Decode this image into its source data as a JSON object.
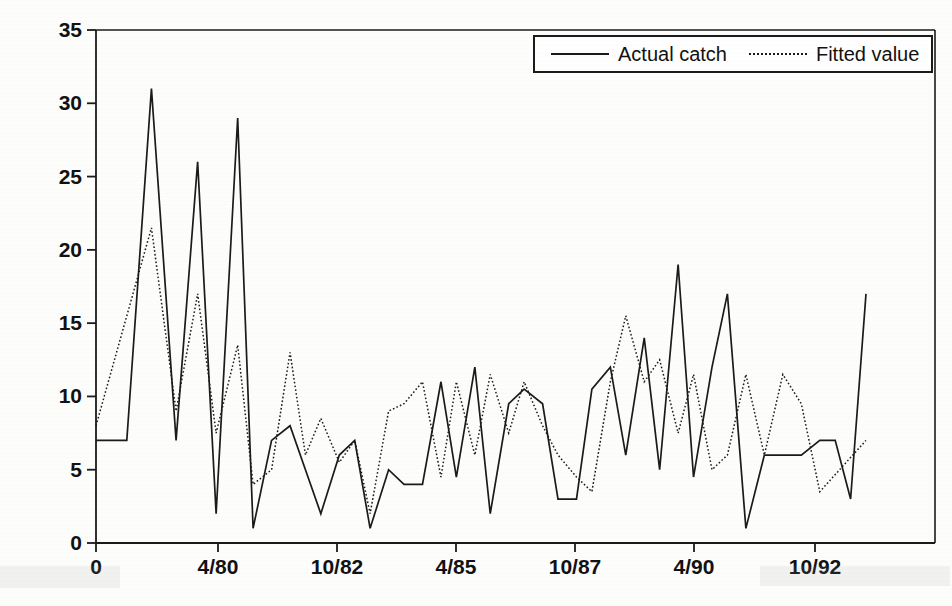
{
  "figure": {
    "background_color": "#fdfdfc",
    "ink_color": "#1a1a1a"
  },
  "legend": {
    "position": "top-right",
    "entries": [
      {
        "label": "Actual catch",
        "style": "solid",
        "swatch": "solid-line-swatch"
      },
      {
        "label": "Fitted value",
        "style": "dotted",
        "swatch": "dotted-line-swatch"
      }
    ]
  },
  "axes": {
    "y_label": "Number caught",
    "y_ticks": [
      "0",
      "5",
      "10",
      "15",
      "20",
      "25",
      "30",
      "35"
    ],
    "x_ticks": [
      "0",
      "4/80",
      "10/82",
      "4/85",
      "10/87",
      "4/90",
      "10/92"
    ],
    "x_label": ""
  },
  "chart_data": {
    "type": "line",
    "title": "",
    "xlabel": "",
    "ylabel": "Number caught",
    "ylim": [
      0,
      35
    ],
    "yticks": [
      0,
      5,
      10,
      15,
      20,
      25,
      30,
      35
    ],
    "xticks_labels": [
      "0",
      "4/80",
      "10/82",
      "4/85",
      "10/87",
      "4/90",
      "10/92"
    ],
    "xticks_index": [
      0,
      14,
      28,
      42,
      56,
      70,
      84
    ],
    "xlim_index": [
      0,
      98
    ],
    "grid": false,
    "legend_position": "top-right",
    "series": [
      {
        "name": "Actual catch",
        "style": "solid",
        "values": [
          7,
          7,
          31,
          7,
          26,
          2,
          29,
          1,
          7,
          8,
          5,
          2,
          6,
          7,
          1,
          5,
          4,
          4,
          11,
          4.5,
          12,
          2,
          9.5,
          10,
          9.5,
          3,
          3,
          10.5,
          12,
          6,
          14,
          5,
          19,
          4.5,
          12,
          17,
          1,
          6,
          6,
          6,
          7,
          7,
          3,
          17
        ]
      },
      {
        "name": "Fitted value",
        "style": "dotted",
        "values": [
          8,
          21.5,
          9,
          17,
          7.5,
          13.5,
          4,
          5,
          13,
          6,
          8.5,
          5.5,
          7,
          2,
          9,
          9.5,
          11,
          4.5,
          11,
          6,
          11.5,
          7.5,
          11,
          8,
          6,
          4.5,
          3.5,
          11,
          15.5,
          11,
          12.5,
          7.5,
          11.5,
          5,
          6,
          11.5,
          6,
          11.5,
          9.5,
          3.5,
          7
        ]
      }
    ]
  },
  "series_points": {
    "actual_catch": [
      [
        0,
        7
      ],
      [
        2,
        7
      ],
      [
        3.6,
        31
      ],
      [
        5.2,
        7
      ],
      [
        6.6,
        26
      ],
      [
        7.8,
        2
      ],
      [
        9.2,
        29
      ],
      [
        10.2,
        1
      ],
      [
        11.4,
        7
      ],
      [
        12.6,
        8
      ],
      [
        13.6,
        5
      ],
      [
        14.6,
        2
      ],
      [
        15.8,
        6
      ],
      [
        16.8,
        7
      ],
      [
        17.8,
        1
      ],
      [
        19.0,
        5
      ],
      [
        20.0,
        4
      ],
      [
        21.2,
        4
      ],
      [
        22.4,
        11
      ],
      [
        23.4,
        4.5
      ],
      [
        24.6,
        12
      ],
      [
        25.6,
        2
      ],
      [
        26.8,
        9.5
      ],
      [
        27.8,
        10.5
      ],
      [
        29.0,
        9.5
      ],
      [
        30.0,
        3
      ],
      [
        31.2,
        3
      ],
      [
        32.2,
        10.5
      ],
      [
        33.4,
        12
      ],
      [
        34.4,
        6
      ],
      [
        35.6,
        14
      ],
      [
        36.6,
        5
      ],
      [
        37.8,
        19
      ],
      [
        38.8,
        4.5
      ],
      [
        40.0,
        12
      ],
      [
        41.0,
        17
      ],
      [
        42.2,
        1
      ],
      [
        43.4,
        6
      ],
      [
        44.6,
        6
      ],
      [
        45.8,
        6
      ],
      [
        47.0,
        7
      ],
      [
        48.0,
        7
      ],
      [
        49.0,
        3
      ],
      [
        50.0,
        17
      ]
    ],
    "fitted_value": [
      [
        0,
        8
      ],
      [
        3.6,
        21.5
      ],
      [
        5.2,
        9
      ],
      [
        6.6,
        17
      ],
      [
        7.8,
        7.5
      ],
      [
        9.2,
        13.5
      ],
      [
        10.2,
        4
      ],
      [
        11.4,
        5
      ],
      [
        12.6,
        13
      ],
      [
        13.6,
        6
      ],
      [
        14.6,
        8.5
      ],
      [
        15.8,
        5.5
      ],
      [
        16.8,
        7
      ],
      [
        17.8,
        2
      ],
      [
        19.0,
        9
      ],
      [
        20.0,
        9.5
      ],
      [
        21.2,
        11
      ],
      [
        22.4,
        4.5
      ],
      [
        23.4,
        11
      ],
      [
        24.6,
        6
      ],
      [
        25.6,
        11.5
      ],
      [
        26.8,
        7.5
      ],
      [
        27.8,
        11
      ],
      [
        29.0,
        8
      ],
      [
        30.0,
        6
      ],
      [
        31.2,
        4.5
      ],
      [
        32.2,
        3.5
      ],
      [
        33.4,
        11
      ],
      [
        34.4,
        15.5
      ],
      [
        35.6,
        11
      ],
      [
        36.6,
        12.5
      ],
      [
        37.8,
        7.5
      ],
      [
        38.8,
        11.5
      ],
      [
        40.0,
        5
      ],
      [
        41.0,
        6
      ],
      [
        42.2,
        11.5
      ],
      [
        43.4,
        6
      ],
      [
        44.6,
        11.5
      ],
      [
        45.8,
        9.5
      ],
      [
        47.0,
        3.5
      ],
      [
        50.0,
        7
      ]
    ]
  }
}
